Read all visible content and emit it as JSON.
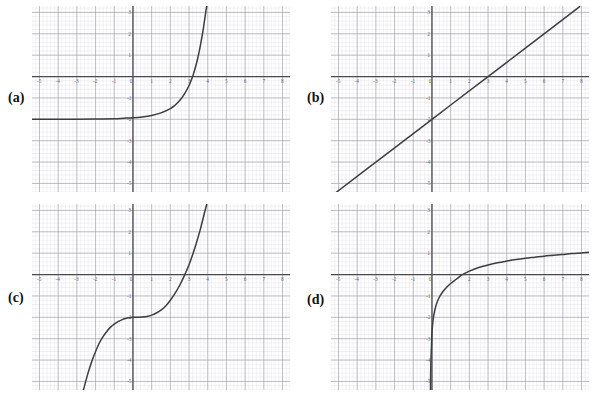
{
  "page": {
    "background": "#ffffff",
    "grid_minor_color": "#d9d9e0",
    "grid_major_color": "#9a9aa6",
    "axis_color": "#4a4a52",
    "curve_color": "#3c3c42",
    "label_color": "#111111",
    "tick_label_color": "#6a6a70"
  },
  "axes": {
    "x_min": -5.4,
    "x_max": 8.4,
    "y_min": -5.4,
    "y_max": 3.3,
    "x_ticks": [
      "-5",
      "-4",
      "-3",
      "-2",
      "-1",
      "0",
      "1",
      "2",
      "3",
      "4",
      "5",
      "6",
      "7",
      "8"
    ],
    "x_tick_values": [
      -5,
      -4,
      -3,
      -2,
      -1,
      0,
      1,
      2,
      3,
      4,
      5,
      6,
      7,
      8
    ],
    "y_ticks": [
      "3",
      "2",
      "1",
      "0",
      "-1",
      "-2",
      "-3",
      "-4",
      "-5"
    ],
    "y_tick_values": [
      3,
      2,
      1,
      0,
      -1,
      -2,
      -3,
      -4,
      -5
    ],
    "minor_step": 0.2,
    "major_step": 1,
    "grid": "on"
  },
  "panels": [
    {
      "id": "a",
      "label": "(a)",
      "label_top": 90,
      "chart_type": "line",
      "curve_name": "exponential-curve",
      "description": "exponential with horizontal asymptote y = -2",
      "asymptote": -2,
      "x_intercept": 3,
      "y_at_zero": -2,
      "points": [
        [
          -5.4,
          -2.0
        ],
        [
          -5.0,
          -2.0
        ],
        [
          -4.0,
          -2.0
        ],
        [
          -3.0,
          -2.0
        ],
        [
          -2.0,
          -1.99
        ],
        [
          -1.0,
          -1.97
        ],
        [
          -0.5,
          -1.95
        ],
        [
          0.0,
          -1.93
        ],
        [
          0.5,
          -1.89
        ],
        [
          1.0,
          -1.82
        ],
        [
          1.5,
          -1.7
        ],
        [
          2.0,
          -1.5
        ],
        [
          2.25,
          -1.34
        ],
        [
          2.5,
          -1.12
        ],
        [
          2.75,
          -0.82
        ],
        [
          3.0,
          -0.42
        ],
        [
          3.15,
          -0.1
        ],
        [
          3.25,
          0.16
        ],
        [
          3.4,
          0.62
        ],
        [
          3.55,
          1.2
        ],
        [
          3.7,
          1.9
        ],
        [
          3.8,
          2.45
        ],
        [
          3.9,
          3.05
        ],
        [
          3.95,
          3.3
        ]
      ]
    },
    {
      "id": "b",
      "label": "(b)",
      "label_top": 90,
      "chart_type": "line",
      "curve_name": "straight-line",
      "description": "straight line through (0,-2) with slope 2/3",
      "slope": 0.6667,
      "y_intercept": -2,
      "x_intercept": 3,
      "points": [
        [
          -5.1,
          -5.4
        ],
        [
          -3.0,
          -4.0
        ],
        [
          0.0,
          -2.0
        ],
        [
          3.0,
          0.0
        ],
        [
          5.0,
          1.33
        ],
        [
          7.9,
          3.27
        ]
      ]
    },
    {
      "id": "c",
      "label": "(c)",
      "label_top": 92,
      "chart_type": "line",
      "curve_name": "cubic-curve",
      "description": "cubic with inflection point at (0,-2)",
      "inflection": [
        0,
        -2
      ],
      "x_intercept": 3,
      "y_at_zero": -2,
      "points": [
        [
          -2.65,
          -5.4
        ],
        [
          -2.4,
          -4.6
        ],
        [
          -2.2,
          -4.05
        ],
        [
          -2.0,
          -3.6
        ],
        [
          -1.8,
          -3.2
        ],
        [
          -1.6,
          -2.9
        ],
        [
          -1.4,
          -2.66
        ],
        [
          -1.2,
          -2.46
        ],
        [
          -1.0,
          -2.32
        ],
        [
          -0.8,
          -2.2
        ],
        [
          -0.6,
          -2.12
        ],
        [
          -0.4,
          -2.06
        ],
        [
          -0.2,
          -2.02
        ],
        [
          0.0,
          -2.0
        ],
        [
          0.25,
          -2.0
        ],
        [
          0.5,
          -1.99
        ],
        [
          0.75,
          -1.96
        ],
        [
          1.0,
          -1.9
        ],
        [
          1.25,
          -1.8
        ],
        [
          1.5,
          -1.66
        ],
        [
          1.75,
          -1.47
        ],
        [
          2.0,
          -1.2
        ],
        [
          2.25,
          -0.88
        ],
        [
          2.5,
          -0.5
        ],
        [
          2.75,
          -0.05
        ],
        [
          3.0,
          0.46
        ],
        [
          3.2,
          0.95
        ],
        [
          3.4,
          1.5
        ],
        [
          3.6,
          2.1
        ],
        [
          3.8,
          2.8
        ],
        [
          3.95,
          3.3
        ]
      ]
    },
    {
      "id": "d",
      "label": "(d)",
      "label_top": 94,
      "chart_type": "line",
      "curve_name": "logarithmic-curve",
      "description": "logarithmic curve with vertical asymptote near x = 0",
      "vertical_asymptote": 0,
      "x_intercept": 1.6,
      "points": [
        [
          -0.08,
          -5.4
        ],
        [
          -0.07,
          -4.6
        ],
        [
          -0.05,
          -3.9
        ],
        [
          -0.02,
          -3.2
        ],
        [
          0.0,
          -2.7
        ],
        [
          0.04,
          -2.3
        ],
        [
          0.08,
          -2.0
        ],
        [
          0.15,
          -1.68
        ],
        [
          0.25,
          -1.35
        ],
        [
          0.4,
          -1.05
        ],
        [
          0.6,
          -0.78
        ],
        [
          0.8,
          -0.58
        ],
        [
          1.0,
          -0.42
        ],
        [
          1.3,
          -0.22
        ],
        [
          1.6,
          -0.02
        ],
        [
          2.0,
          0.16
        ],
        [
          2.5,
          0.33
        ],
        [
          3.0,
          0.45
        ],
        [
          3.5,
          0.55
        ],
        [
          4.0,
          0.63
        ],
        [
          4.5,
          0.7
        ],
        [
          5.0,
          0.76
        ],
        [
          5.5,
          0.81
        ],
        [
          6.0,
          0.86
        ],
        [
          6.5,
          0.9
        ],
        [
          7.0,
          0.94
        ],
        [
          7.5,
          0.98
        ],
        [
          8.0,
          1.01
        ],
        [
          8.4,
          1.04
        ]
      ]
    }
  ]
}
